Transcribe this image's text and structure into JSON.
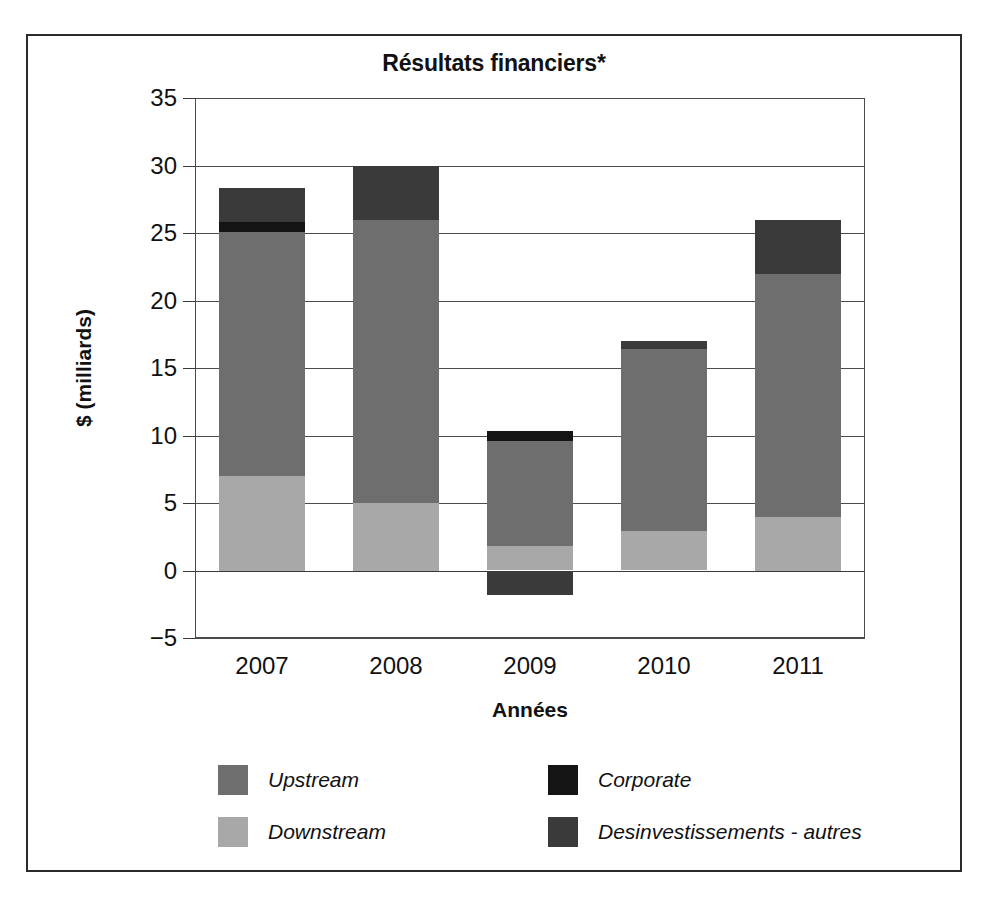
{
  "figure": {
    "title": "Résultats financiers*"
  },
  "chart_data": {
    "type": "bar",
    "stacked": true,
    "title": "Résultats financiers*",
    "xlabel": "Années",
    "ylabel": "$ (milliards)",
    "categories": [
      "2007",
      "2008",
      "2009",
      "2010",
      "2011"
    ],
    "ylim": [
      -5,
      35
    ],
    "yticks": [
      35,
      30,
      25,
      20,
      15,
      10,
      5,
      0,
      -5
    ],
    "ytick_labels": [
      "35",
      "30",
      "25",
      "20",
      "15",
      "10",
      "5",
      "0",
      "−5"
    ],
    "grid": true,
    "legend_position": "bottom",
    "series": [
      {
        "name": "Downstream",
        "color": "#a8a8a8",
        "values": [
          7.0,
          5.0,
          1.8,
          2.9,
          4.0
        ]
      },
      {
        "name": "Upstream",
        "color": "#6e6e6e",
        "values": [
          18.1,
          21.0,
          7.8,
          13.5,
          18.0
        ]
      },
      {
        "name": "Corporate",
        "color": "#141414",
        "values": [
          0.7,
          0.0,
          0.7,
          0.0,
          0.0
        ]
      },
      {
        "name": "Desinvestissements - autres",
        "color": "#3a3a3a",
        "values": [
          2.5,
          4.0,
          -1.8,
          0.6,
          4.0
        ]
      }
    ],
    "totals": [
      28.3,
      30.0,
      10.3,
      17.0,
      26.0
    ],
    "annotations": []
  },
  "legend": {
    "items": [
      {
        "label": "Upstream",
        "color": "#6e6e6e"
      },
      {
        "label": "Corporate",
        "color": "#141414"
      },
      {
        "label": "Downstream",
        "color": "#a8a8a8"
      },
      {
        "label": "Desinvestissements - autres",
        "color": "#3a3a3a"
      }
    ]
  }
}
